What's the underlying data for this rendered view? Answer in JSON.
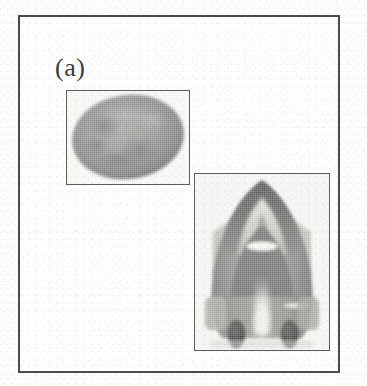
{
  "figure": {
    "panel_label": "(a)",
    "background_color": "#fdfdfc",
    "frame_color": "#4a4a4a",
    "subimage_border_color": "#5c5c5c"
  },
  "subimages": [
    {
      "id": "ellipsoid",
      "name": "oval-grayscale-object",
      "description": "Tilted oval grayscale object filling the frame",
      "fill_color": "#8d8d8a",
      "edge_color": "#5f5f5d",
      "highlight_color": "#a9a9a5",
      "frame": {
        "x": 64,
        "y": 88,
        "width": 124,
        "height": 95
      }
    },
    {
      "id": "render",
      "name": "shaded-arch-render",
      "description": "Shaded three dimensional arch shaped render with two dark rounded features at the base",
      "fill_color": "#8b8b88",
      "edge_color": "#4d4d4b",
      "highlight_color": "#e6e5e1",
      "dark_feature_color": "#3a3a38",
      "frame": {
        "x": 192,
        "y": 171,
        "width": 136,
        "height": 178
      }
    }
  ]
}
